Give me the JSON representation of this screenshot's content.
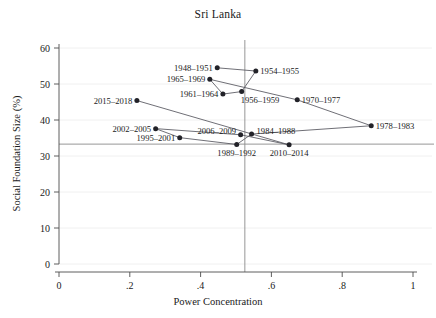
{
  "chart_data": {
    "type": "scatter",
    "title": "Sri Lanka",
    "xlabel": "Power Concentration",
    "ylabel": "Social Foundation Size (%)",
    "xlim": [
      0,
      1
    ],
    "ylim": [
      0,
      60
    ],
    "xticks": [
      "0",
      ".2",
      ".4",
      ".6",
      ".8",
      "1"
    ],
    "xtick_values": [
      0,
      0.2,
      0.4,
      0.6,
      0.8,
      1
    ],
    "yticks": [
      "0",
      "10",
      "20",
      "30",
      "40",
      "50",
      "60"
    ],
    "ytick_values": [
      0,
      10,
      20,
      30,
      40,
      50,
      60
    ],
    "grid": true,
    "legend": "none",
    "connected": true,
    "reference_lines": {
      "vertical_x": 0.525,
      "horizontal_y": 33.3
    },
    "points": [
      {
        "label": "1948–1951",
        "x": 0.447,
        "y": 54.5,
        "label_side": "left"
      },
      {
        "label": "1954–1955",
        "x": 0.556,
        "y": 53.6,
        "label_side": "right"
      },
      {
        "label": "1956–1959",
        "x": 0.516,
        "y": 47.9,
        "label_side": "right-below"
      },
      {
        "label": "1961–1964",
        "x": 0.463,
        "y": 47.2,
        "label_side": "left"
      },
      {
        "label": "1965–1969",
        "x": 0.426,
        "y": 51.3,
        "label_side": "left"
      },
      {
        "label": "1970–1977",
        "x": 0.673,
        "y": 45.6,
        "label_side": "right"
      },
      {
        "label": "1978–1983",
        "x": 0.882,
        "y": 38.4,
        "label_side": "right"
      },
      {
        "label": "1984–1988",
        "x": 0.544,
        "y": 36.1,
        "label_side": "right-above"
      },
      {
        "label": "1989–1992",
        "x": 0.502,
        "y": 33.2,
        "label_side": "below"
      },
      {
        "label": "1995–2001",
        "x": 0.341,
        "y": 35.1,
        "label_side": "left"
      },
      {
        "label": "2002–2005",
        "x": 0.273,
        "y": 37.6,
        "label_side": "left"
      },
      {
        "label": "2006–2009",
        "x": 0.513,
        "y": 35.9,
        "label_side": "left-above"
      },
      {
        "label": "2010–2014",
        "x": 0.65,
        "y": 33.1,
        "label_side": "below"
      },
      {
        "label": "2015–2018",
        "x": 0.22,
        "y": 45.4,
        "label_side": "left"
      }
    ],
    "colors": {
      "marker": "#222228",
      "line": "#55555d",
      "axis": "#4d4d4d",
      "grid": "#ececec",
      "reference": "#8a8a8a",
      "text": "#1a1a1a",
      "background": "#ffffff"
    }
  }
}
